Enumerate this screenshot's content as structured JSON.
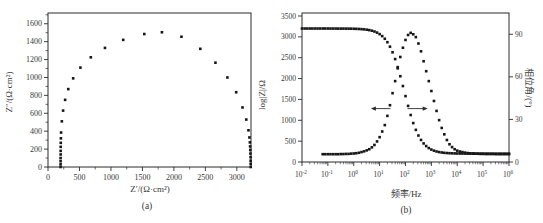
{
  "style": {
    "background": "#ffffff",
    "ink": "#2b2b2b",
    "marker_color": "#161616",
    "text_color": "#383838",
    "marker_size": 2.6
  },
  "chart_data": [
    {
      "id": "nyquist",
      "type": "scatter",
      "sublabel": "(a)",
      "xlabel": "Z′/(Ω·cm²)",
      "ylabel": "Z″/(Ω·cm²)",
      "xlim": [
        0,
        3225
      ],
      "ylim": [
        0,
        1720
      ],
      "xticks": [
        0,
        500,
        1000,
        1500,
        2000,
        2500,
        3000
      ],
      "yticks": [
        0,
        200,
        400,
        600,
        800,
        1000,
        1200,
        1400,
        1600
      ],
      "x_minor_step": 250,
      "y_minor_step": 100,
      "grid": false,
      "marker": "square",
      "points": [
        [
          200,
          0
        ],
        [
          200,
          30
        ],
        [
          200,
          65
        ],
        [
          200,
          100
        ],
        [
          201,
          140
        ],
        [
          201,
          180
        ],
        [
          202,
          225
        ],
        [
          203,
          270
        ],
        [
          205,
          320
        ],
        [
          208,
          385
        ],
        [
          220,
          510
        ],
        [
          240,
          630
        ],
        [
          272,
          750
        ],
        [
          322,
          870
        ],
        [
          400,
          990
        ],
        [
          515,
          1110
        ],
        [
          680,
          1225
        ],
        [
          905,
          1330
        ],
        [
          1195,
          1420
        ],
        [
          1530,
          1485
        ],
        [
          1810,
          1505
        ],
        [
          2120,
          1455
        ],
        [
          2420,
          1320
        ],
        [
          2660,
          1165
        ],
        [
          2850,
          1000
        ],
        [
          2990,
          835
        ],
        [
          3090,
          665
        ],
        [
          3150,
          530
        ],
        [
          3185,
          410
        ],
        [
          3200,
          330
        ],
        [
          3207,
          275
        ],
        [
          3211,
          230
        ],
        [
          3214,
          190
        ],
        [
          3216,
          150
        ],
        [
          3218,
          110
        ],
        [
          3219,
          70
        ],
        [
          3220,
          35
        ],
        [
          3220,
          0
        ]
      ]
    },
    {
      "id": "bode",
      "type": "scatter",
      "sublabel": "(b)",
      "xlabel": "频率/Hz",
      "ylabel_left": "log|Z|/Ω",
      "ylabel_right": "相位角/(°)",
      "x_log_range": [
        -2,
        6
      ],
      "xticks_log": [
        -2,
        -1,
        0,
        1,
        2,
        3,
        4,
        5,
        6
      ],
      "ylim_left": [
        0,
        3500
      ],
      "yticks_left": [
        0,
        500,
        1000,
        1500,
        2000,
        2500,
        3000,
        3500
      ],
      "ylim_right": [
        0,
        105
      ],
      "yticks_right": [
        0,
        30,
        60,
        90
      ],
      "grid": false,
      "marker": "square",
      "series": [
        {
          "name": "impedance-magnitude",
          "axis": "left",
          "x_start": -2.0,
          "x_step": 0.1,
          "values": [
            3200,
            3200,
            3200,
            3200,
            3200,
            3200,
            3200,
            3200,
            3200,
            3200,
            3200,
            3199,
            3199,
            3199,
            3198,
            3198,
            3198,
            3197,
            3197,
            3196,
            3194,
            3192,
            3189,
            3185,
            3180,
            3172,
            3162,
            3148,
            3128,
            3102,
            3066,
            3018,
            2954,
            2872,
            2765,
            2630,
            2467,
            2274,
            2056,
            1821,
            1580,
            1345,
            1126,
            933,
            770,
            635,
            529,
            445,
            382,
            334,
            298,
            272,
            252,
            238,
            228,
            220,
            215,
            211,
            208,
            206,
            204,
            203,
            202,
            202,
            201,
            201,
            201,
            200,
            200,
            200,
            200,
            200,
            200,
            200,
            200,
            200,
            200,
            200,
            200,
            200,
            200
          ]
        },
        {
          "name": "phase-angle",
          "axis": "right",
          "x_start": -1.2,
          "x_step": 0.1,
          "values": [
            5.5,
            5.5,
            5.5,
            5.5,
            5.5,
            5.5,
            5.5,
            5.6,
            5.6,
            5.7,
            5.7,
            5.9,
            6.0,
            6.2,
            6.5,
            7.0,
            7.5,
            8.2,
            9.0,
            10.3,
            12.0,
            14.5,
            17.5,
            21.5,
            26.0,
            32.5,
            40.0,
            48.5,
            57.0,
            66.0,
            74.0,
            80.5,
            86.0,
            89.5,
            91.0,
            90.0,
            88.0,
            83.5,
            78.0,
            71.0,
            64.0,
            57.0,
            50.0,
            43.0,
            36.0,
            29.5,
            24.0,
            19.5,
            15.5,
            12.5,
            10.5,
            9.0,
            8.0,
            7.4,
            7.0,
            6.6,
            6.3,
            6.1,
            6.0,
            5.9,
            5.8,
            5.7,
            5.7,
            5.6,
            5.6,
            5.6,
            5.6,
            5.5,
            5.5,
            5.5,
            5.5,
            5.5,
            5.5
          ]
        }
      ],
      "annotations": {
        "arrows": [
          {
            "direction": "left",
            "x_log_tail": 1.42,
            "x_log_tip": 0.72,
            "y_left": 1280
          },
          {
            "direction": "right",
            "x_log_tail": 2.08,
            "x_log_tip": 2.8,
            "y_left": 1280
          }
        ]
      }
    }
  ]
}
